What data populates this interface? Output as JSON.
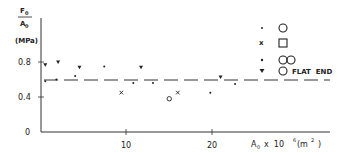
{
  "chart_data": {
    "type": "scatter",
    "title": "",
    "ylabel": "F0/A0 (MPa)",
    "ylabel_parts": {
      "numerator": "F0",
      "denominator": "A0",
      "unit": "(MPa)"
    },
    "xlabel": "A0 x 10^6 (m^2)",
    "xlabel_text": "A0  x  10⁶(m²)",
    "xlim": [
      0,
      34
    ],
    "ylim": [
      0,
      0.9
    ],
    "xticks": [
      10,
      20
    ],
    "xtick_labels": [
      "10",
      "20"
    ],
    "yticks": [
      0,
      0.4,
      0.8
    ],
    "ytick_labels": [
      "0",
      "0.4",
      "0.8"
    ],
    "grid": false,
    "legend_position": "upper right",
    "reference_line": {
      "style": "dashed",
      "y": 0.59
    },
    "series": [
      {
        "name": "○",
        "marker": "dot",
        "points": [
          [
            0.5,
            0.58
          ],
          [
            1.8,
            0.6
          ],
          [
            4.0,
            0.64
          ],
          [
            7.4,
            0.75
          ],
          [
            10.8,
            0.56
          ],
          [
            13.1,
            0.56
          ],
          [
            19.8,
            0.45
          ],
          [
            22.7,
            0.55
          ]
        ]
      },
      {
        "name": "□",
        "marker": "x",
        "points": [
          [
            9.4,
            0.45
          ],
          [
            16.0,
            0.45
          ]
        ]
      },
      {
        "name": "○○",
        "marker": "circle",
        "points": [
          [
            15.0,
            0.38
          ]
        ]
      },
      {
        "name": "○ FLAT END",
        "marker": "triangle-down",
        "points": [
          [
            0.5,
            0.77
          ],
          [
            2.0,
            0.8
          ],
          [
            4.5,
            0.74
          ],
          [
            11.7,
            0.74
          ],
          [
            21.0,
            0.63
          ]
        ]
      }
    ]
  },
  "legend": [
    {
      "marker_glyph": "•",
      "shape": "circle",
      "label": ""
    },
    {
      "marker_glyph": "x",
      "shape": "square",
      "label": ""
    },
    {
      "marker_glyph": "•",
      "shape": "double-circle",
      "label": ""
    },
    {
      "marker_glyph": "▼",
      "shape": "circle",
      "label": "FLAT END"
    }
  ],
  "labels": {
    "y_num": "F",
    "y_num_sub": "0",
    "y_den": "A",
    "y_den_sub": "0",
    "y_unit": "(MPa)",
    "x_axis": "A",
    "x_axis_sub": "0",
    "x_axis_rest": "x  10",
    "x_axis_exp": "6",
    "x_axis_unit": "(m",
    "x_axis_unit_exp": "2",
    "x_axis_close": ")",
    "tick_0": "0",
    "tick_04": "0.4",
    "tick_08": "0.8",
    "tick_10": "10",
    "tick_20": "20",
    "flat_end": "FLAT  END"
  }
}
